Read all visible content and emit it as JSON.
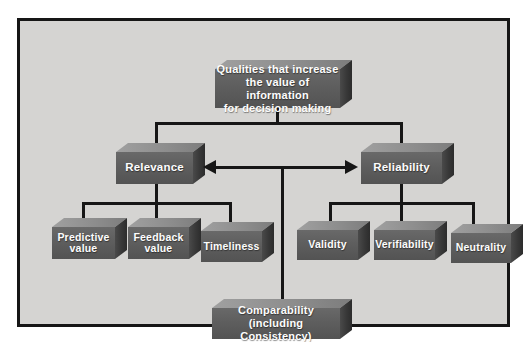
{
  "colors": {
    "frame_bg": "#d5d4d2",
    "box_front": "#5e5e5e",
    "box_top": "#8c8c8c",
    "box_side": "#383838",
    "line": "#161616",
    "label_text": "#fdfdfd"
  },
  "nodes": {
    "root": {
      "label": "Qualities that increase\nthe value of information\nfor decision making"
    },
    "relevance": {
      "label": "Relevance"
    },
    "reliability": {
      "label": "Reliability"
    },
    "predictive": {
      "label": "Predictive\nvalue"
    },
    "feedback": {
      "label": "Feedback\nvalue"
    },
    "timeliness": {
      "label": "Timeliness"
    },
    "validity": {
      "label": "Validity"
    },
    "verifiability": {
      "label": "Verifiability"
    },
    "neutrality": {
      "label": "Neutrality"
    },
    "comparability": {
      "label": "Comparability\n(including Consistency)"
    }
  }
}
